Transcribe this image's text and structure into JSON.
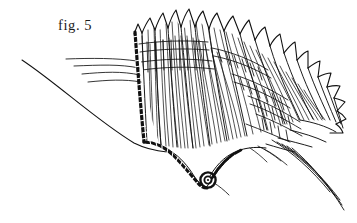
{
  "plate": {
    "name": "figure-plate",
    "background_color": "#ffffff",
    "ink_color": "#111111",
    "width": 357,
    "height": 223
  },
  "caption": {
    "text": "fig. 5",
    "position": {
      "x": 58,
      "y": 17
    },
    "font_size_px": 14.5,
    "color": "#1a1a1a"
  },
  "illustration": {
    "subject": "fan-shaped appendage line drawing",
    "style": "pen-and-ink scientific line drawing",
    "parts": [
      {
        "name": "long-sweeping-curve",
        "description": "long thin arc entering from upper-left, descending to lower-right to the fan base",
        "path": "M 22 60 C 60 86 100 124 140 146 C 152 151 160 152 168 152"
      },
      {
        "name": "beaded-margin-band",
        "description": "dark dotted/beaded thick margin running down the left edge of the fan and curving along the lower edge to the coil",
        "bead_count": 62,
        "color": "#111111"
      },
      {
        "name": "spiral-coil",
        "description": "small tight spiral at the lower end of the beaded margin with a short projecting bristle",
        "center": {
          "x": 208,
          "y": 180
        },
        "radius": 7
      },
      {
        "name": "left-filaments",
        "description": "four long thin filaments extending leftward from the fan base",
        "count": 4
      },
      {
        "name": "lower-right-filaments",
        "description": "five long thin filaments sweeping down and to the right from the fan's outer base",
        "count": 5
      },
      {
        "name": "spine-tips",
        "description": "row of pointed spiny tips along the upper and outer margin of the fan",
        "count": 22
      },
      {
        "name": "vertical-striations",
        "description": "dense fine vertical/radial striations filling the interior of the fan blades",
        "count": 40
      },
      {
        "name": "cross-hatch-bands",
        "description": "ladder-like transverse cross-hatching bands across the fan rays, denser toward the outer margin",
        "count": 9
      }
    ]
  }
}
